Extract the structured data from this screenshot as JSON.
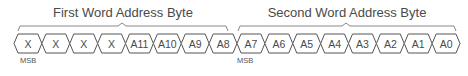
{
  "groups": [
    {
      "title": "First Word Address Byte",
      "msb_label": "MSB",
      "cells": [
        "X",
        "X",
        "X",
        "X",
        "A11",
        "A10",
        "A9",
        "A8"
      ]
    },
    {
      "title": "Second Word Address Byte",
      "msb_label": "MSB",
      "cells": [
        "A7",
        "A6",
        "A5",
        "A4",
        "A3",
        "A2",
        "A1",
        "A0"
      ]
    }
  ],
  "colors": {
    "stroke": "#555555",
    "text": "#4a4a4a",
    "bracket": "#888888"
  }
}
